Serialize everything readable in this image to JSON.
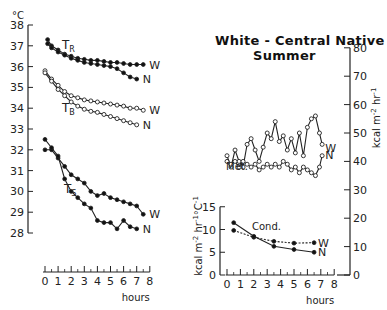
{
  "title": {
    "line1": "White - Central Native",
    "line2": "Summer"
  },
  "chart_data": [
    {
      "type": "line",
      "title": "Body temperatures",
      "xlabel": "hours",
      "ylabel": "°C",
      "ylim": [
        28,
        38
      ],
      "xlim": [
        0,
        8
      ],
      "yticks": [
        "28",
        "29",
        "30",
        "31",
        "32",
        "33",
        "34",
        "35",
        "36",
        "37",
        "38"
      ],
      "xticks": [
        "0",
        "1",
        "2",
        "3",
        "4",
        "5",
        "6",
        "7",
        "8"
      ],
      "grid": false,
      "groups": [
        {
          "label": "TR",
          "marker": "filled",
          "series": [
            {
              "name": "W",
              "x": [
                0.2,
                0.5,
                1,
                1.5,
                2,
                2.5,
                3,
                3.5,
                4,
                4.5,
                5,
                5.5,
                6,
                6.5,
                7,
                7.5
              ],
              "values": [
                37.3,
                37.0,
                36.8,
                36.6,
                36.5,
                36.4,
                36.35,
                36.3,
                36.3,
                36.25,
                36.2,
                36.2,
                36.15,
                36.1,
                36.1,
                36.1
              ]
            },
            {
              "name": "N",
              "x": [
                0.2,
                0.5,
                1,
                1.5,
                2,
                2.5,
                3,
                3.5,
                4,
                4.5,
                5,
                5.5,
                6,
                6.5,
                7
              ],
              "values": [
                37.1,
                36.9,
                36.7,
                36.55,
                36.4,
                36.3,
                36.2,
                36.15,
                36.1,
                36.05,
                36.0,
                35.9,
                35.7,
                35.5,
                35.4
              ]
            }
          ]
        },
        {
          "label": "TB",
          "marker": "open",
          "series": [
            {
              "name": "W",
              "x": [
                0,
                0.5,
                1,
                1.5,
                2,
                2.5,
                3,
                3.5,
                4,
                4.5,
                5,
                5.5,
                6,
                6.5,
                7,
                7.5
              ],
              "values": [
                35.8,
                35.4,
                35.1,
                34.8,
                34.6,
                34.5,
                34.4,
                34.35,
                34.3,
                34.25,
                34.2,
                34.15,
                34.1,
                34.0,
                34.0,
                33.9
              ]
            },
            {
              "name": "N",
              "x": [
                0,
                0.5,
                1,
                1.5,
                2,
                2.5,
                3,
                3.5,
                4,
                4.5,
                5,
                5.5,
                6,
                6.5,
                7
              ],
              "values": [
                35.7,
                35.3,
                34.9,
                34.6,
                34.3,
                34.1,
                33.95,
                33.85,
                33.8,
                33.7,
                33.6,
                33.5,
                33.4,
                33.3,
                33.2
              ]
            }
          ]
        },
        {
          "label": "TS",
          "marker": "filled",
          "series": [
            {
              "name": "W",
              "x": [
                0,
                0.5,
                1,
                1.5,
                2,
                2.5,
                3,
                3.5,
                4,
                4.5,
                5,
                5.5,
                6,
                6.5,
                7,
                7.5
              ],
              "values": [
                32.0,
                32.0,
                31.6,
                31.2,
                30.8,
                30.6,
                30.4,
                30.0,
                29.8,
                29.9,
                29.7,
                29.6,
                29.5,
                29.4,
                29.3,
                28.9
              ]
            },
            {
              "name": "N",
              "x": [
                0,
                0.5,
                1,
                1.5,
                2,
                2.5,
                3,
                3.5,
                4,
                4.5,
                5,
                5.5,
                6,
                6.5,
                7
              ],
              "values": [
                32.5,
                32.1,
                31.7,
                30.6,
                30.0,
                29.7,
                29.4,
                29.2,
                28.6,
                28.5,
                28.5,
                28.2,
                28.6,
                28.3,
                28.2
              ]
            }
          ]
        }
      ],
      "annotations": [
        "TR",
        "TB",
        "TS",
        "W",
        "N"
      ]
    },
    {
      "type": "line",
      "title": "Met. and Cond.",
      "xlabel": "hours",
      "ylabel_left": "kcal m-2 hr-1 °C-1",
      "ylabel_right": "kcal m-2 hr-1",
      "ylim_left": [
        0,
        15
      ],
      "ylim_right": [
        0,
        80
      ],
      "xlim": [
        0,
        8
      ],
      "yticks_left": [
        "0",
        "5",
        "10",
        "15"
      ],
      "yticks_right": [
        "0",
        "10",
        "20",
        "30",
        "40",
        "50",
        "60",
        "70",
        "80"
      ],
      "xticks": [
        "0",
        "1",
        "2",
        "3",
        "4",
        "5",
        "6",
        "7",
        "8"
      ],
      "grid": false,
      "groups": [
        {
          "label": "Met.",
          "axis": "right",
          "marker": "open",
          "series": [
            {
              "name": "W",
              "x": [
                0,
                0.3,
                0.6,
                0.9,
                1.2,
                1.5,
                1.8,
                2.1,
                2.4,
                2.7,
                3.0,
                3.3,
                3.6,
                3.9,
                4.2,
                4.5,
                4.8,
                5.1,
                5.4,
                5.7,
                6.0,
                6.3,
                6.6,
                6.9,
                7.1
              ],
              "values": [
                42,
                38,
                44,
                40,
                38,
                46,
                48,
                44,
                40,
                45,
                50,
                48,
                54,
                47,
                49,
                44,
                48,
                43,
                50,
                42,
                52,
                55,
                56,
                50,
                46
              ]
            },
            {
              "name": "N",
              "x": [
                0,
                0.3,
                0.6,
                0.9,
                1.2,
                1.5,
                1.8,
                2.1,
                2.4,
                2.7,
                3.0,
                3.3,
                3.6,
                3.9,
                4.2,
                4.5,
                4.8,
                5.1,
                5.4,
                5.7,
                6.0,
                6.3,
                6.6,
                6.9,
                7.1
              ],
              "values": [
                40,
                39,
                40,
                38,
                40,
                39,
                38,
                39,
                37,
                38,
                39,
                38,
                39,
                38,
                40,
                39,
                37,
                38,
                36,
                38,
                37,
                36,
                35,
                38,
                42
              ]
            }
          ]
        },
        {
          "label": "Cond.",
          "axis": "left",
          "marker": "filled",
          "series": [
            {
              "name": "W",
              "x": [
                0.5,
                2,
                3.5,
                5,
                6.5
              ],
              "values": [
                9.8,
                8.3,
                7.4,
                7.0,
                7.1
              ]
            },
            {
              "name": "N",
              "x": [
                0.5,
                2,
                3.5,
                5,
                6.5
              ],
              "values": [
                11.5,
                8.5,
                6.3,
                5.6,
                5.0
              ]
            }
          ]
        }
      ],
      "annotations": [
        "Met.",
        "Cond.",
        "W",
        "N"
      ]
    }
  ]
}
